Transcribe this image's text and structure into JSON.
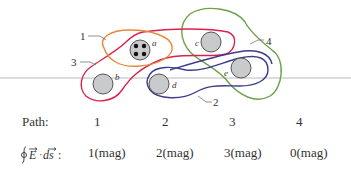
{
  "figure": {
    "wires": [
      {
        "label": "a",
        "type": "bundle",
        "strands": 4
      },
      {
        "label": "b",
        "type": "single"
      },
      {
        "label": "c",
        "type": "single"
      },
      {
        "label": "d",
        "type": "single"
      },
      {
        "label": "e",
        "type": "single"
      }
    ],
    "paths": [
      {
        "label": "1",
        "color": "#e8883a"
      },
      {
        "label": "2",
        "color": "#3b3a8c"
      },
      {
        "label": "3",
        "color": "#d8234f"
      },
      {
        "label": "4",
        "color": "#6ba24a"
      }
    ],
    "wire_fill": "#c8cacb",
    "wire_stroke": "#555555",
    "horizon_line_color": "#b8b8b8"
  },
  "table": {
    "path_header": "Path:",
    "integral_header": "∮E · ds:",
    "columns": [
      {
        "path": "1",
        "value": "1(mag)"
      },
      {
        "path": "2",
        "value": "2(mag)"
      },
      {
        "path": "3",
        "value": "3(mag)"
      },
      {
        "path": "4",
        "value": "0(mag)"
      }
    ]
  }
}
